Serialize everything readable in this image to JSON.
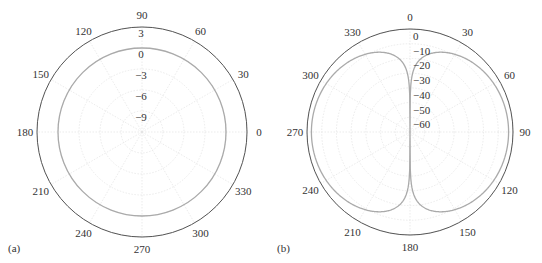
{
  "chart_data": [
    {
      "type": "polar",
      "panel_label": "(a)",
      "center": [
        142,
        132
      ],
      "radius": 105,
      "radial_ticks": [
        "3",
        "0",
        "-3",
        "-6",
        "-9"
      ],
      "radial_range": [
        -12,
        3
      ],
      "angle_ticks": [
        "0",
        "30",
        "60",
        "90",
        "120",
        "150",
        "180",
        "210",
        "240",
        "270",
        "300",
        "330"
      ],
      "angle_zero": "east",
      "angle_direction": "counterclockwise",
      "series": [
        {
          "name": "pattern",
          "description": "omnidirectional circle at 0 dB",
          "value_db": 0
        }
      ]
    },
    {
      "type": "polar",
      "panel_label": "(b)",
      "center": [
        410,
        132
      ],
      "radius": 103,
      "radial_ticks": [
        "0",
        "-10",
        "-20",
        "-30",
        "-40",
        "-50",
        "-60"
      ],
      "radial_range": [
        -70,
        0
      ],
      "angle_ticks": [
        "0",
        "30",
        "60",
        "90",
        "120",
        "150",
        "180",
        "210",
        "240",
        "270",
        "300",
        "330"
      ],
      "angle_zero": "north",
      "angle_direction": "clockwise",
      "series": [
        {
          "name": "pattern",
          "description": "figure-eight dipole pattern, 20*log10|sin(theta)|, null along 0/180",
          "peak_db": -3
        }
      ]
    }
  ]
}
